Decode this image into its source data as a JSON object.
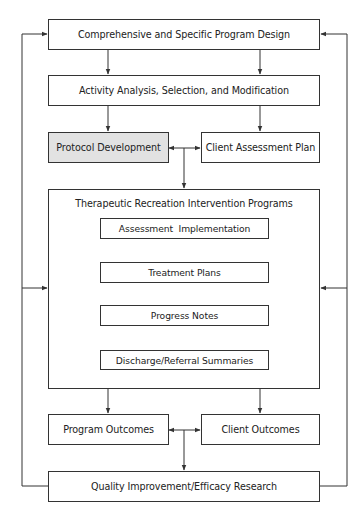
{
  "diagram": {
    "type": "flowchart",
    "colors": {
      "line": "#333333",
      "highlight_fill": "#e2e2e2",
      "background": "#ffffff"
    },
    "nodes": {
      "program_design": "Comprehensive and Specific Program Design",
      "activity_analysis": "Activity Analysis, Selection, and Modification",
      "protocol_development": "Protocol Development",
      "client_assessment_plan": "Client Assessment Plan",
      "intervention_programs": {
        "title": "Therapeutic Recreation Intervention Programs",
        "steps": [
          "Assessment  Implementation",
          "Treatment Plans",
          "Progress Notes",
          "Discharge/Referral Summaries"
        ]
      },
      "program_outcomes": "Program Outcomes",
      "client_outcomes": "Client Outcomes",
      "quality_improvement": "Quality Improvement/Efficacy Research"
    },
    "edges": [
      {
        "from": "Comprehensive and Specific Program Design",
        "to": "Activity Analysis, Selection, and Modification"
      },
      {
        "from": "Activity Analysis, Selection, and Modification",
        "to": "Protocol Development"
      },
      {
        "from": "Activity Analysis, Selection, and Modification",
        "to": "Client Assessment Plan"
      },
      {
        "from": "Protocol Development",
        "to": "Client Assessment Plan",
        "bidirectional": true
      },
      {
        "from": "Protocol / Client Assessment junction",
        "to": "Therapeutic Recreation Intervention Programs"
      },
      {
        "from": "Assessment  Implementation",
        "to": "Treatment Plans"
      },
      {
        "from": "Treatment Plans",
        "to": "Progress Notes"
      },
      {
        "from": "Progress Notes",
        "to": "Discharge/Referral Summaries"
      },
      {
        "from": "Therapeutic Recreation Intervention Programs",
        "to": "Program Outcomes"
      },
      {
        "from": "Therapeutic Recreation Intervention Programs",
        "to": "Client Outcomes"
      },
      {
        "from": "Program Outcomes",
        "to": "Client Outcomes",
        "bidirectional": true
      },
      {
        "from": "Outcomes junction",
        "to": "Quality Improvement/Efficacy Research"
      },
      {
        "from": "Quality Improvement/Efficacy Research",
        "to": "Comprehensive and Specific Program Design",
        "via": "left and right feedback loops"
      },
      {
        "from": "Quality Improvement/Efficacy Research",
        "to": "Therapeutic Recreation Intervention Programs",
        "via": "left and right feedback loops"
      }
    ]
  }
}
